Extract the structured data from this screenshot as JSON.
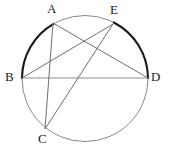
{
  "figure": {
    "kind": "circle-geometry-diagram",
    "canvas": {
      "width": 169,
      "height": 154
    },
    "circle": {
      "cx": 85,
      "cy": 78.5,
      "r": 63,
      "stroke_color": "#8a8a8a",
      "stroke_width": 1
    },
    "highlight_arcs": [
      {
        "name": "arc-b-to-a",
        "from": "B",
        "to": "A",
        "stroke_color": "#1a1a1a",
        "stroke_width": 2.1
      },
      {
        "name": "arc-e-to-d",
        "from": "E",
        "to": "D",
        "stroke_color": "#1a1a1a",
        "stroke_width": 2.1
      }
    ],
    "points": [
      {
        "id": "A",
        "label": "A",
        "x": 53,
        "y": 23,
        "label_x": 47,
        "label_y": 2
      },
      {
        "id": "E",
        "label": "E",
        "x": 113,
        "y": 24,
        "label_x": 110,
        "label_y": 3
      },
      {
        "id": "B",
        "label": "B",
        "x": 22,
        "y": 78,
        "label_x": 5,
        "label_y": 70
      },
      {
        "id": "D",
        "label": "D",
        "x": 148,
        "y": 78,
        "label_x": 151,
        "label_y": 70
      },
      {
        "id": "C",
        "label": "C",
        "x": 45,
        "y": 129,
        "label_x": 38,
        "label_y": 132
      }
    ],
    "chords": [
      {
        "name": "chord-b-d",
        "from": "B",
        "to": "D",
        "stroke_color": "#8f8f8f",
        "stroke_width": 1
      },
      {
        "name": "chord-a-c",
        "from": "A",
        "to": "C",
        "stroke_color": "#6f6f6f",
        "stroke_width": 1
      },
      {
        "name": "chord-a-d",
        "from": "A",
        "to": "D",
        "stroke_color": "#6f6f6f",
        "stroke_width": 1
      },
      {
        "name": "chord-b-e",
        "from": "B",
        "to": "E",
        "stroke_color": "#6f6f6f",
        "stroke_width": 1
      },
      {
        "name": "chord-c-e",
        "from": "C",
        "to": "E",
        "stroke_color": "#6f6f6f",
        "stroke_width": 1
      }
    ]
  }
}
